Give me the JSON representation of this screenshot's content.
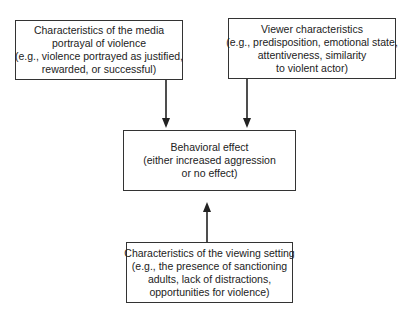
{
  "diagram": {
    "nodes": {
      "media": {
        "lines": [
          "Characteristics of the media",
          "portrayal of violence",
          "(e.g., violence portrayed as justified,",
          "rewarded, or successful)"
        ]
      },
      "viewer": {
        "lines": [
          "Viewer characteristics",
          "(e.g., predisposition, emotional state,",
          "attentiveness, similarity",
          "to violent actor)"
        ]
      },
      "effect": {
        "lines": [
          "Behavioral effect",
          "(either increased aggression",
          "or no effect)"
        ]
      },
      "setting": {
        "lines": [
          "Characteristics of the viewing setting",
          "(e.g., the presence of sanctioning",
          "adults, lack of distractions,",
          "opportunities for violence)"
        ]
      }
    },
    "edges": [
      {
        "from": "media",
        "to": "effect"
      },
      {
        "from": "viewer",
        "to": "effect"
      },
      {
        "from": "setting",
        "to": "effect"
      }
    ],
    "colors": {
      "line": "#222222",
      "background": "#ffffff"
    }
  }
}
